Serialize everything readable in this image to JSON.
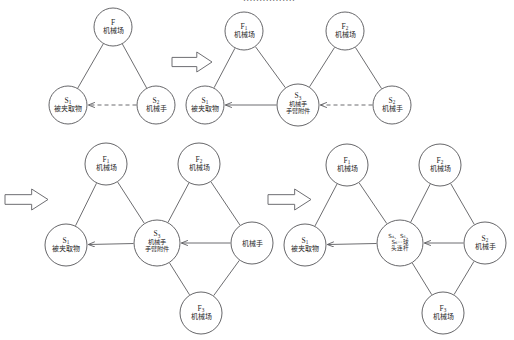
{
  "page": {
    "header_partial_text": "................",
    "background": "#ffffff",
    "stroke_color": "#5c5c60",
    "text_color": "#1f1f1f"
  },
  "labels": {
    "field": "机械场",
    "gripped_object": "被夹取物",
    "manipulator": "机械手",
    "arm_attachment_1": "机械手",
    "arm_attachment_2": "手臂附件",
    "ball_link_1": "S₄、S₅、",
    "ball_link_2": "S₆···球",
    "ball_link_3": "头连杆",
    "F": "F",
    "F1": "F",
    "F2": "F",
    "F3": "F",
    "S1": "S",
    "S2": "S",
    "S3": "S",
    "sub1": "1",
    "sub2": "2",
    "sub3": "3"
  },
  "diagrams": [
    {
      "id": "diagram-1",
      "name": "initial-triangle",
      "nodes": [
        {
          "key": "F",
          "id": "F",
          "sub": "",
          "text": "机械场",
          "cx": 113,
          "cy": 27,
          "r": 19
        },
        {
          "key": "S1",
          "id": "S",
          "sub": "1",
          "text": "被夹取物",
          "cx": 68,
          "cy": 105,
          "r": 19
        },
        {
          "key": "S2",
          "id": "S",
          "sub": "2",
          "text": "机械手",
          "cx": 156,
          "cy": 105,
          "r": 19
        }
      ],
      "edges": [
        {
          "from": "F",
          "to": "S1",
          "style": "solid",
          "arrow": false
        },
        {
          "from": "F",
          "to": "S2",
          "style": "solid",
          "arrow": false
        },
        {
          "from": "S2",
          "to": "S1",
          "style": "dashed",
          "arrow": true
        }
      ]
    },
    {
      "id": "diagram-2",
      "name": "two-field-chain",
      "nodes": [
        {
          "key": "F1",
          "id": "F",
          "sub": "1",
          "text": "机械场",
          "cx": 244,
          "cy": 31,
          "r": 19
        },
        {
          "key": "F2",
          "id": "F",
          "sub": "2",
          "text": "机械场",
          "cx": 345,
          "cy": 31,
          "r": 19
        },
        {
          "key": "S1",
          "id": "S",
          "sub": "1",
          "text": "被夹取物",
          "cx": 205,
          "cy": 105,
          "r": 19
        },
        {
          "key": "S3",
          "id": "S",
          "sub": "3",
          "text": "机械手手臂附件",
          "cx": 298,
          "cy": 105,
          "r": 21
        },
        {
          "key": "S2",
          "id": "S",
          "sub": "2",
          "text": "机械手",
          "cx": 392,
          "cy": 105,
          "r": 19
        }
      ],
      "edges": [
        {
          "from": "F1",
          "to": "S1",
          "style": "solid",
          "arrow": false
        },
        {
          "from": "F1",
          "to": "S3",
          "style": "solid",
          "arrow": false
        },
        {
          "from": "F2",
          "to": "S3",
          "style": "solid",
          "arrow": false
        },
        {
          "from": "F2",
          "to": "S2",
          "style": "solid",
          "arrow": false
        },
        {
          "from": "S3",
          "to": "S1",
          "style": "solid",
          "arrow": true
        },
        {
          "from": "S2",
          "to": "S3",
          "style": "dashed",
          "arrow": true
        }
      ]
    },
    {
      "id": "diagram-3",
      "name": "three-field-chain",
      "nodes": [
        {
          "key": "F1",
          "id": "F",
          "sub": "1",
          "text": "机械场",
          "cx": 106,
          "cy": 164,
          "r": 21
        },
        {
          "key": "F2",
          "id": "F",
          "sub": "2",
          "text": "机械场",
          "cx": 199,
          "cy": 164,
          "r": 21
        },
        {
          "key": "F3",
          "id": "F",
          "sub": "3",
          "text": "机械场",
          "cx": 201,
          "cy": 313,
          "r": 21
        },
        {
          "key": "S1",
          "id": "S",
          "sub": "1",
          "text": "被夹取物",
          "cx": 66,
          "cy": 245,
          "r": 21
        },
        {
          "key": "S3",
          "id": "S",
          "sub": "3",
          "text": "机械手手臂附件",
          "cx": 157,
          "cy": 243,
          "r": 23
        },
        {
          "key": "M",
          "id": "",
          "sub": "",
          "text": "机械手",
          "cx": 252,
          "cy": 243,
          "r": 21
        }
      ],
      "edges": [
        {
          "from": "F1",
          "to": "S1",
          "style": "solid",
          "arrow": false
        },
        {
          "from": "F1",
          "to": "S3",
          "style": "solid",
          "arrow": false
        },
        {
          "from": "F2",
          "to": "S3",
          "style": "solid",
          "arrow": false
        },
        {
          "from": "F2",
          "to": "M",
          "style": "solid",
          "arrow": false
        },
        {
          "from": "F3",
          "to": "S3",
          "style": "solid",
          "arrow": false
        },
        {
          "from": "F3",
          "to": "M",
          "style": "solid",
          "arrow": false
        },
        {
          "from": "S3",
          "to": "S1",
          "style": "solid",
          "arrow": true
        },
        {
          "from": "M",
          "to": "S3",
          "style": "solid",
          "arrow": true
        }
      ]
    },
    {
      "id": "diagram-4",
      "name": "ball-link-chain",
      "nodes": [
        {
          "key": "F1",
          "id": "F",
          "sub": "1",
          "text": "机械场",
          "cx": 347,
          "cy": 165,
          "r": 21
        },
        {
          "key": "F2",
          "id": "F",
          "sub": "2",
          "text": "机械场",
          "cx": 440,
          "cy": 165,
          "r": 21
        },
        {
          "key": "F3",
          "id": "F",
          "sub": "3",
          "text": "机械场",
          "cx": 443,
          "cy": 313,
          "r": 21
        },
        {
          "key": "S1",
          "id": "S",
          "sub": "1",
          "text": "被夹取物",
          "cx": 305,
          "cy": 245,
          "r": 21
        },
        {
          "key": "SB",
          "id": "",
          "sub": "",
          "text": "S₄、S₅、S₆···球头连杆",
          "cx": 400,
          "cy": 243,
          "r": 23
        },
        {
          "key": "S2",
          "id": "S",
          "sub": "2",
          "text": "机械手",
          "cx": 485,
          "cy": 243,
          "r": 21
        }
      ],
      "edges": [
        {
          "from": "F1",
          "to": "S1",
          "style": "solid",
          "arrow": false
        },
        {
          "from": "F1",
          "to": "SB",
          "style": "solid",
          "arrow": false
        },
        {
          "from": "F2",
          "to": "SB",
          "style": "solid",
          "arrow": false
        },
        {
          "from": "F2",
          "to": "S2",
          "style": "solid",
          "arrow": false
        },
        {
          "from": "F3",
          "to": "SB",
          "style": "solid",
          "arrow": false
        },
        {
          "from": "F3",
          "to": "S2",
          "style": "solid",
          "arrow": false
        },
        {
          "from": "SB",
          "to": "S1",
          "style": "solid",
          "arrow": true
        },
        {
          "from": "S2",
          "to": "SB",
          "style": "solid",
          "arrow": true
        }
      ]
    }
  ],
  "transition_arrows": [
    {
      "name": "transition-arrow-top",
      "x": 172,
      "y": 52,
      "w": 40,
      "h": 20
    },
    {
      "name": "transition-arrow-left",
      "x": 5,
      "y": 189,
      "w": 43,
      "h": 21
    },
    {
      "name": "transition-arrow-middle",
      "x": 268,
      "y": 189,
      "w": 43,
      "h": 21
    }
  ]
}
